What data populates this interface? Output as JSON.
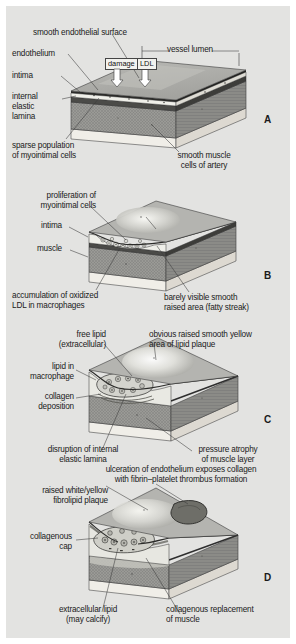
{
  "figure": {
    "background_color": "#e3e3e1",
    "page_color": "#ffffff"
  },
  "panels": [
    {
      "letter": "A",
      "stage": "normal-artery-with-endothelial-damage",
      "labels": {
        "smooth_endothelial_surface": "smooth endothelial surface",
        "endothelium": "endothelium",
        "intima": "intima",
        "internal_elastic_lamina": "internal\nelastic\nlamina",
        "sparse_myointimal": "sparse population\nof myointimal cells",
        "vessel_lumen": "vessel lumen",
        "smooth_muscle": "smooth muscle\ncells of artery"
      },
      "callouts": [
        {
          "name": "damage",
          "text": "damage"
        },
        {
          "name": "ldl",
          "text": "LDL"
        }
      ]
    },
    {
      "letter": "B",
      "stage": "fatty-streak",
      "labels": {
        "proliferation": "proliferation of\nmyointimal cells",
        "intima": "intima",
        "muscle": "muscle",
        "accumulation": "accumulation of oxidized\nLDL in macrophages",
        "raised_area": "barely visible smooth\nraised area (fatty streak)"
      }
    },
    {
      "letter": "C",
      "stage": "lipid-plaque",
      "labels": {
        "free_lipid": "free lipid\n(extracellular)",
        "lipid_in_macrophage": "lipid in\nmacrophage",
        "collagen_deposition": "collagen\ndeposition",
        "obvious_raised": "obvious raised smooth yellow\narea of lipid plaque",
        "disruption": "disruption of internal\nelastic lamina",
        "pressure_atrophy": "pressure atrophy\nof muscle layer"
      }
    },
    {
      "letter": "D",
      "stage": "complicated-plaque-with-thrombus",
      "labels": {
        "ulceration": "ulceration of endothelium exposes collagen\nwith fibrin–platelet thrombus formation",
        "raised_plaque": "raised white/yellow\nfibrolipid plaque",
        "collagenous_cap": "collagenous\ncap",
        "extracellular_lipid": "extracellular lipid\n(may calcify)",
        "collagenous_replacement": "collagenous replacement\nof muscle"
      }
    }
  ]
}
